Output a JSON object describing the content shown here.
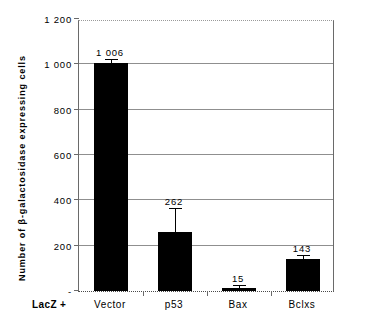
{
  "chart_data": {
    "type": "bar",
    "title": "",
    "subtitle": "",
    "xlabel": "LacZ +",
    "ylabel": "Number of  β-galactosidase  expressing  cells",
    "categories": [
      "Vector",
      "p53",
      "Bax",
      "Bclxs"
    ],
    "values": [
      1006,
      262,
      15,
      143
    ],
    "value_labels": [
      "1 006",
      "262",
      "15",
      "143"
    ],
    "errors": [
      14,
      98,
      6,
      12
    ],
    "series": [
      {
        "name": "β-galactosidase expressing cells",
        "values": [
          1006,
          262,
          15,
          143
        ],
        "errors": [
          14,
          98,
          6,
          12
        ],
        "color": "#000000"
      }
    ],
    "ylim": [
      0,
      1200
    ],
    "ytick_values": [
      0,
      200,
      400,
      600,
      800,
      1000,
      1200
    ],
    "ytick_labels": [
      "-",
      "200",
      "400",
      "600",
      "800",
      "1 000",
      "1 200"
    ],
    "gridlines": {
      "horizontal": true,
      "values": [
        200,
        400,
        600,
        800,
        1000
      ],
      "color": "#8f8f8f"
    },
    "legend": {
      "visible": false,
      "position": "none"
    },
    "bar_color": "#000000",
    "plot_border_color": "#6a6a6a",
    "background_color": "#ffffff"
  },
  "axis": {
    "x_prefix": "LacZ +"
  }
}
